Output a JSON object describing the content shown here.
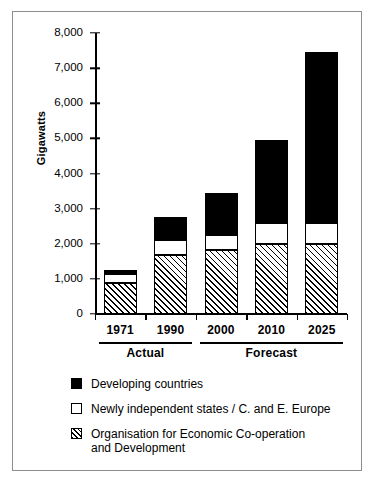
{
  "chart_data": {
    "type": "bar",
    "stacked": true,
    "title": "",
    "subtitle": "",
    "xlabel": "",
    "ylabel": "Gigawatts",
    "ylim": [
      0,
      8000
    ],
    "ytick_labels": [
      "8,000",
      "7,000",
      "6,000",
      "5,000",
      "4,000",
      "3,000",
      "2,000",
      "1,000",
      "0"
    ],
    "ytick_values": [
      8000,
      7000,
      6000,
      5000,
      4000,
      3000,
      2000,
      1000,
      0
    ],
    "grid": false,
    "legend_position": "below",
    "categories": [
      "1971",
      "1990",
      "2000",
      "2010",
      "2025"
    ],
    "series": [
      {
        "name": "Organisation for Economic Co-operation and Development",
        "key": "oecd",
        "style": "hatch",
        "values": [
          870,
          1680,
          1820,
          2000,
          2000
        ]
      },
      {
        "name": "Newly independent states / C. and E. Europe",
        "key": "nis",
        "style": "white",
        "values": [
          260,
          440,
          430,
          600,
          600
        ]
      },
      {
        "name": "Developing countries",
        "key": "developing",
        "style": "black",
        "values": [
          120,
          630,
          1190,
          2350,
          4850
        ]
      }
    ],
    "stack_totals": [
      1250,
      2750,
      3440,
      4950,
      7450
    ],
    "annotations": [
      {
        "label": "Actual",
        "categories": [
          "1971",
          "1990"
        ]
      },
      {
        "label": "Forecast",
        "categories": [
          "2000",
          "2010",
          "2025"
        ]
      }
    ]
  },
  "axis": {
    "y_title": "Gigawatts",
    "ticks": [
      "8,000",
      "7,000",
      "6,000",
      "5,000",
      "4,000",
      "3,000",
      "2,000",
      "1,000",
      "0"
    ]
  },
  "xaxis": {
    "labels": [
      "1971",
      "1990",
      "2000",
      "2010",
      "2025"
    ]
  },
  "groups": [
    {
      "label": "Actual"
    },
    {
      "label": "Forecast"
    }
  ],
  "legend": {
    "items": [
      {
        "swatch": "black",
        "label": "Developing countries"
      },
      {
        "swatch": "white",
        "label": "Newly independent states / C. and E. Europe"
      },
      {
        "swatch": "hatch",
        "label": "Organisation for Economic Co-operation\nand Development"
      }
    ]
  },
  "colors": {
    "developing": "#000000",
    "nis": "#ffffff",
    "oecd_hatch": "#000000",
    "frame": "#8d8d8d",
    "axis": "#000000",
    "background": "#ffffff"
  }
}
